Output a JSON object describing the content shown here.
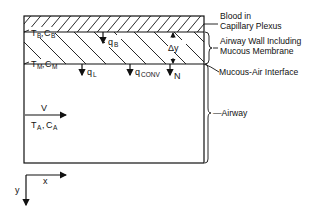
{
  "diagram": {
    "regions": {
      "blood": {
        "label_line1": "Blood in",
        "label_line2": "Capillary Plexus"
      },
      "wall": {
        "label_line1": "Airway Wall Including",
        "label_line2": "Mucous Membrane"
      },
      "interface": {
        "label": "Mucous-Air Interface"
      },
      "airway": {
        "label": "—Airway"
      }
    },
    "symbols": {
      "tb": "T",
      "tb_sub": "B",
      "cb": "C",
      "cb_sub": "B",
      "tm": "T",
      "tm_sub": "M",
      "cm": "C",
      "cm_sub": "M",
      "ta": "T",
      "ta_sub": "A",
      "ca": "C",
      "ca_sub": "A",
      "qb": "q",
      "qb_sub": "B",
      "ql": "q",
      "ql_sub": "L",
      "qconv": "q",
      "qconv_sub": "CONV",
      "n": "N",
      "dy": "Δy",
      "v": "V",
      "comma": ","
    },
    "axes": {
      "x": "x",
      "y": "y"
    }
  }
}
